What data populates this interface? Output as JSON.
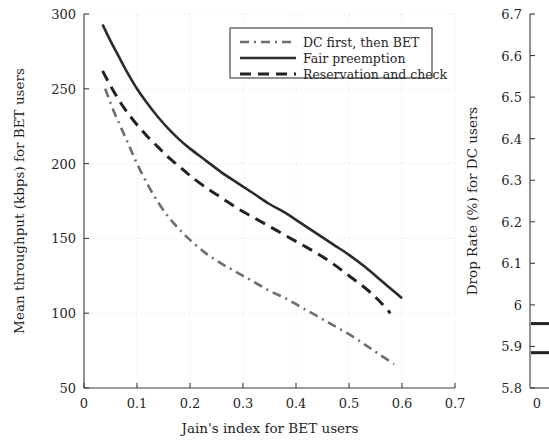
{
  "chart_data": [
    {
      "id": "main",
      "type": "line",
      "title": "",
      "xlabel": "Jain's index for BET users",
      "ylabel": "Mean throughput (kbps) for BET users",
      "xlim": [
        0,
        0.7
      ],
      "ylim": [
        50,
        300
      ],
      "xticks": [
        "0",
        "0.1",
        "0.2",
        "0.3",
        "0.4",
        "0.5",
        "0.6",
        "0.7"
      ],
      "xtick_values": [
        0,
        0.1,
        0.2,
        0.3,
        0.4,
        0.5,
        0.6,
        0.7
      ],
      "yticks": [
        "50",
        "100",
        "150",
        "200",
        "250",
        "300"
      ],
      "ytick_values": [
        50,
        100,
        150,
        200,
        250,
        300
      ],
      "grid": true,
      "legend_position": "top-right",
      "series": [
        {
          "name": "DC first, then BET",
          "style": "dashdot",
          "color": "#6e6e6e",
          "width": 2.6,
          "points": [
            [
              0.04,
              250
            ],
            [
              0.055,
              236
            ],
            [
              0.07,
              224
            ],
            [
              0.085,
              212
            ],
            [
              0.1,
              200
            ],
            [
              0.12,
              186
            ],
            [
              0.14,
              174
            ],
            [
              0.16,
              164
            ],
            [
              0.18,
              156
            ],
            [
              0.2,
              149
            ],
            [
              0.23,
              140
            ],
            [
              0.26,
              133
            ],
            [
              0.29,
              127
            ],
            [
              0.32,
              121
            ],
            [
              0.35,
              115
            ],
            [
              0.38,
              110
            ],
            [
              0.41,
              104
            ],
            [
              0.44,
              98
            ],
            [
              0.47,
              92
            ],
            [
              0.5,
              86
            ],
            [
              0.53,
              79
            ],
            [
              0.555,
              73
            ],
            [
              0.585,
              66
            ]
          ]
        },
        {
          "name": "Fair preemption",
          "style": "solid",
          "color": "#2b2b2b",
          "width": 2.6,
          "points": [
            [
              0.035,
              293
            ],
            [
              0.05,
              282
            ],
            [
              0.065,
              272
            ],
            [
              0.08,
              262
            ],
            [
              0.1,
              250
            ],
            [
              0.12,
              240
            ],
            [
              0.14,
              231
            ],
            [
              0.16,
              223
            ],
            [
              0.18,
              216
            ],
            [
              0.2,
              210
            ],
            [
              0.23,
              202
            ],
            [
              0.26,
              194
            ],
            [
              0.29,
              187
            ],
            [
              0.32,
              180
            ],
            [
              0.35,
              173
            ],
            [
              0.38,
              167
            ],
            [
              0.41,
              160
            ],
            [
              0.44,
              153
            ],
            [
              0.47,
              146
            ],
            [
              0.5,
              139
            ],
            [
              0.53,
              131
            ],
            [
              0.56,
              122
            ],
            [
              0.58,
              116
            ],
            [
              0.6,
              110
            ]
          ]
        },
        {
          "name": "Reservation and check",
          "style": "dashed",
          "color": "#222222",
          "width": 3.0,
          "points": [
            [
              0.035,
              262
            ],
            [
              0.05,
              252
            ],
            [
              0.065,
              243
            ],
            [
              0.08,
              235
            ],
            [
              0.1,
              226
            ],
            [
              0.12,
              218
            ],
            [
              0.14,
              211
            ],
            [
              0.16,
              204
            ],
            [
              0.18,
              198
            ],
            [
              0.2,
              192
            ],
            [
              0.23,
              184
            ],
            [
              0.26,
              177
            ],
            [
              0.29,
              170
            ],
            [
              0.32,
              164
            ],
            [
              0.35,
              158
            ],
            [
              0.38,
              152
            ],
            [
              0.41,
              146
            ],
            [
              0.44,
              140
            ],
            [
              0.47,
              133
            ],
            [
              0.5,
              125
            ],
            [
              0.53,
              117
            ],
            [
              0.555,
              109
            ],
            [
              0.578,
              100
            ]
          ]
        }
      ]
    },
    {
      "id": "right-partial",
      "type": "line",
      "title": "",
      "xlabel": "",
      "ylabel": "Drop Rate (%) for DC users",
      "ylim": [
        5.8,
        6.7
      ],
      "yticks": [
        "5.8",
        "5.9",
        "6",
        "6.1",
        "6.2",
        "6.3",
        "6.4",
        "6.5",
        "6.6",
        "6.7"
      ],
      "ytick_values": [
        5.8,
        5.9,
        6.0,
        6.1,
        6.2,
        6.3,
        6.4,
        6.5,
        6.6,
        6.7
      ],
      "xticks": [
        "0"
      ],
      "xtick_values": [
        0
      ],
      "grid": false,
      "marks": [
        {
          "y_from": 5.955,
          "y_to": 5.955,
          "color": "#222222"
        },
        {
          "y_from": 5.885,
          "y_to": 5.885,
          "color": "#222222"
        }
      ]
    }
  ]
}
